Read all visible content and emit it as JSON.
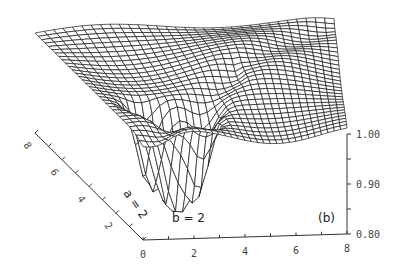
{
  "chart_data": {
    "type": "surface3d",
    "panel_label": "(b)",
    "annotations": [
      {
        "text": "a = 2",
        "rotated": true
      },
      {
        "text": "b = 2"
      }
    ],
    "x_axis": {
      "label": "",
      "ticks": [
        "0",
        "2",
        "4",
        "6",
        "8"
      ],
      "range": [
        0,
        8
      ]
    },
    "y_axis": {
      "label": "",
      "ticks": [
        "2",
        "4",
        "6",
        "8"
      ],
      "range": [
        0,
        8
      ]
    },
    "z_axis": {
      "label": "",
      "ticks": [
        "0.80",
        "0.90",
        "1.00"
      ],
      "range": [
        0.8,
        1.0
      ]
    },
    "grid": false,
    "mesh_resolution": 32,
    "surface_description": "Wireframe surface near 1.0 across the plane, with a deep multi-lobed trough (minimum ~0.80) near a = 2, b = 2, and ridge/fold features along the diagonal.",
    "features": [
      {
        "type": "minimum",
        "x": 2,
        "y": 2,
        "z": 0.8
      },
      {
        "type": "minimum",
        "x": 1.4,
        "y": 2.6,
        "z": 0.85
      },
      {
        "type": "minimum",
        "x": 2.7,
        "y": 1.5,
        "z": 0.86
      },
      {
        "type": "plateau",
        "z": 1.0
      }
    ]
  }
}
